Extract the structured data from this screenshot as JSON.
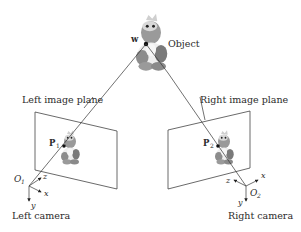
{
  "diagram": {
    "object": {
      "label": "Object",
      "point_label": "w"
    },
    "left": {
      "plane_label": "Left image plane",
      "point_label": "P",
      "point_sub": "1",
      "origin_label": "O",
      "origin_sub": "1",
      "camera_label": "Left camera",
      "axes": {
        "x": "x",
        "y": "y",
        "z": "z"
      }
    },
    "right": {
      "plane_label": "Right image plane",
      "point_label": "P",
      "point_sub": "2",
      "origin_label": "O",
      "origin_sub": "2",
      "camera_label": "Right camera",
      "axes": {
        "x": "x",
        "y": "y",
        "z": "z"
      }
    },
    "colors": {
      "line": "#333333",
      "toy_body": "#8a8a8a",
      "toy_light": "#e6e6e6"
    }
  }
}
